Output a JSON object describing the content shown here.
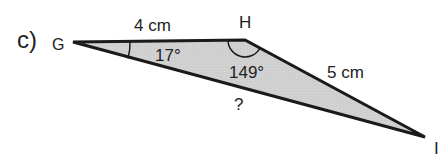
{
  "problem": {
    "label": "c)",
    "vertices": {
      "G": "G",
      "H": "H",
      "I": "I"
    },
    "sides": {
      "GH": "4 cm",
      "HI": "5 cm",
      "GI": "?"
    },
    "angles": {
      "G": "17°",
      "H": "149°"
    },
    "colors": {
      "fill": "#d4d4d4",
      "stroke": "#1a1a1a"
    }
  }
}
